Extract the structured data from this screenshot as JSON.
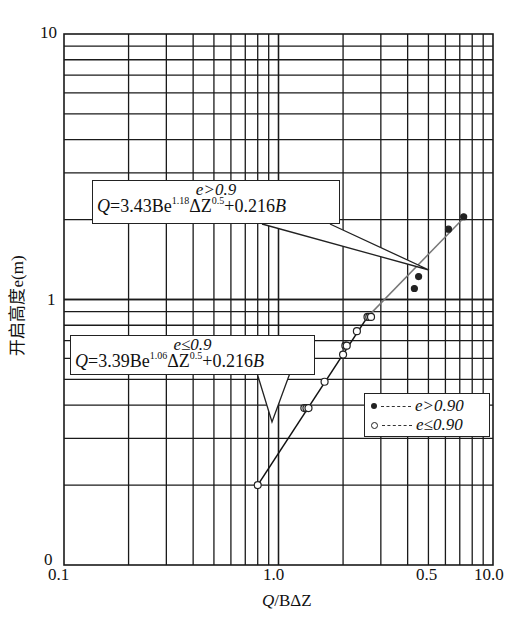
{
  "chart_data": {
    "type": "scatter",
    "title": "",
    "xlabel": "Q/BΔZ",
    "ylabel": "开启高度e(m)",
    "xscale": "log",
    "yscale": "log",
    "xlim": [
      0.1,
      10.0
    ],
    "ylim": [
      0.1,
      10
    ],
    "x_tick_labels": [
      "0.1",
      "1.0",
      "0.5",
      "10.0"
    ],
    "y_tick_labels": [
      "0",
      "1",
      "10"
    ],
    "grid": true,
    "legend_position": "lower right",
    "legend": [
      {
        "marker": "filled-circle",
        "line": "dashed",
        "label": "e>0.90"
      },
      {
        "marker": "open-circle",
        "line": "dashed",
        "label": "e≤0.90"
      }
    ],
    "annotations": [
      {
        "condition": "e>0.9",
        "equation": "Q=3.43Be^1.18 ΔZ^0.5+0.216B"
      },
      {
        "condition": "e≤0.9",
        "equation": "Q=3.39Be^1.06 ΔZ^0.5+0.216B"
      }
    ],
    "series": [
      {
        "name": "e>0.90",
        "marker": "filled",
        "x": [
          4.3,
          4.5,
          6.2,
          7.3
        ],
        "y": [
          1.1,
          1.22,
          1.84,
          2.05
        ]
      },
      {
        "name": "e≤0.90",
        "marker": "open",
        "x": [
          0.8,
          1.32,
          1.35,
          1.38,
          1.64,
          2.0,
          2.05,
          2.08,
          2.32,
          2.6,
          2.65,
          2.7
        ],
        "y": [
          0.2,
          0.39,
          0.39,
          0.39,
          0.49,
          0.62,
          0.67,
          0.67,
          0.76,
          0.86,
          0.86,
          0.86
        ]
      }
    ],
    "fit_lines": [
      {
        "name": "e≤0.9 fit",
        "from": [
          0.8,
          0.2
        ],
        "to": [
          2.6,
          0.86
        ],
        "color": "#111111"
      },
      {
        "name": "e>0.9 fit",
        "from": [
          2.6,
          0.86
        ],
        "to": [
          7.4,
          2.05
        ],
        "color": "#777777"
      }
    ]
  },
  "axes": {
    "y_ticks": {
      "top": "10",
      "mid": "1",
      "bottom": "0"
    },
    "x_ticks": {
      "t0": "0.1",
      "t1": "1.0",
      "t2": "0.5",
      "t3": "10.0"
    },
    "xlabel_q": "Q",
    "xlabel_rest": "/BΔZ",
    "ylabel": "开启高度e(m)"
  },
  "annotations": {
    "upper": {
      "cond": "e>0.9",
      "q": "Q",
      "a": "=3.43Be",
      "exp1": "1.18",
      "b": "ΔZ",
      "exp2": "0.5",
      "c": "+0.216",
      "d": "B"
    },
    "lower": {
      "cond": "e≤0.9",
      "q": "Q",
      "a": "=3.39Be",
      "exp1": "1.06",
      "b": "ΔZ",
      "exp2": "0.5",
      "c": "+0.216",
      "d": "B"
    }
  },
  "legend": {
    "item1": "e>0.90",
    "item2": "e≤0.90"
  },
  "colors": {
    "grid": "#1a1a1a",
    "line_lower": "#111111",
    "line_upper": "#777777"
  }
}
